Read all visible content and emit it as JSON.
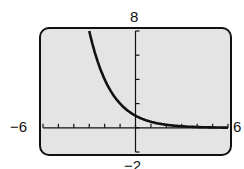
{
  "chart_data": {
    "type": "line",
    "title": "",
    "xlabel": "",
    "ylabel": "",
    "xlim": [
      -6,
      6
    ],
    "ylim": [
      -2,
      8
    ],
    "tick_labels": {
      "xmin": "−6",
      "xmax": "6",
      "ymax": "8",
      "ymin": "−2"
    },
    "grid": false,
    "series": [
      {
        "name": "y = 0.5^x",
        "x": [
          -3,
          -2,
          -1,
          0,
          1,
          2,
          3,
          4,
          5,
          6
        ],
        "values": [
          8,
          4,
          2,
          1,
          0.5,
          0.25,
          0.125,
          0.0625,
          0.031,
          0.016
        ]
      }
    ],
    "x_ticks_every": 1,
    "y_ticks_every": 2
  },
  "colors": {
    "background": "#e4e4e4",
    "frame": "#111111",
    "curve": "#111111"
  }
}
